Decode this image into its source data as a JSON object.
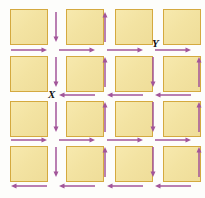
{
  "figure": {
    "name": "lattice-domain-diagram",
    "background_color": "#fdfdfb",
    "width": 205,
    "height": 198
  },
  "colors": {
    "square_fill": "#f4e4a4",
    "square_fill_light": "#f7e9ae",
    "square_border": "#d4a93f",
    "arrow": "#a2559a",
    "arrow_alt": "#9c4f93",
    "label_text": "#111111"
  },
  "grid": {
    "rows": 4,
    "columns": 4,
    "square_width": 38,
    "square_height": 36,
    "origin_x": 10,
    "origin_y": 9,
    "step_x": 48,
    "step_y": 45
  },
  "labels": [
    {
      "id": "label-y",
      "text": "Y",
      "x": 152,
      "y": 38
    },
    {
      "id": "label-x",
      "text": "X",
      "x": 48,
      "y": 89
    }
  ],
  "vertical_arrows": [
    {
      "id": "v-r0-g0",
      "x": 56,
      "y": 12,
      "length": 30,
      "direction": "down"
    },
    {
      "id": "v-r0-g1",
      "x": 105,
      "y": 12,
      "length": 30,
      "direction": "up"
    },
    {
      "id": "v-r1-g0",
      "x": 56,
      "y": 57,
      "length": 30,
      "direction": "down"
    },
    {
      "id": "v-r1-g1",
      "x": 105,
      "y": 57,
      "length": 30,
      "direction": "up"
    },
    {
      "id": "v-r1-g2",
      "x": 153,
      "y": 57,
      "length": 30,
      "direction": "down"
    },
    {
      "id": "v-r2-g0",
      "x": 56,
      "y": 102,
      "length": 30,
      "direction": "down"
    },
    {
      "id": "v-r2-g1",
      "x": 105,
      "y": 102,
      "length": 30,
      "direction": "up"
    },
    {
      "id": "v-r2-g2",
      "x": 153,
      "y": 102,
      "length": 30,
      "direction": "down"
    },
    {
      "id": "v-r3-g0",
      "x": 56,
      "y": 147,
      "length": 30,
      "direction": "down"
    },
    {
      "id": "v-r3-g1",
      "x": 105,
      "y": 147,
      "length": 30,
      "direction": "up"
    },
    {
      "id": "v-r3-g2",
      "x": 153,
      "y": 147,
      "length": 30,
      "direction": "down"
    },
    {
      "id": "v-edge-r1",
      "x": 199,
      "y": 57,
      "length": 30,
      "direction": "up"
    },
    {
      "id": "v-edge-r2",
      "x": 199,
      "y": 102,
      "length": 30,
      "direction": "up"
    },
    {
      "id": "v-edge-r3",
      "x": 199,
      "y": 147,
      "length": 30,
      "direction": "up"
    }
  ],
  "horizontal_arrows": [
    {
      "id": "h-b0-c0",
      "x": 11,
      "y": 50,
      "length": 36,
      "direction": "right"
    },
    {
      "id": "h-b0-c1",
      "x": 59,
      "y": 50,
      "length": 36,
      "direction": "right"
    },
    {
      "id": "h-b0-c2",
      "x": 107,
      "y": 50,
      "length": 36,
      "direction": "right"
    },
    {
      "id": "h-b0-c3",
      "x": 155,
      "y": 50,
      "length": 36,
      "direction": "right"
    },
    {
      "id": "h-b1-c1",
      "x": 59,
      "y": 95,
      "length": 36,
      "direction": "left"
    },
    {
      "id": "h-b1-c2",
      "x": 107,
      "y": 95,
      "length": 36,
      "direction": "left"
    },
    {
      "id": "h-b1-c3",
      "x": 155,
      "y": 95,
      "length": 36,
      "direction": "left"
    },
    {
      "id": "h-b2-c0",
      "x": 11,
      "y": 140,
      "length": 36,
      "direction": "right"
    },
    {
      "id": "h-b2-c1",
      "x": 59,
      "y": 140,
      "length": 36,
      "direction": "right"
    },
    {
      "id": "h-b2-c2",
      "x": 107,
      "y": 140,
      "length": 36,
      "direction": "right"
    },
    {
      "id": "h-b2-c3",
      "x": 155,
      "y": 140,
      "length": 36,
      "direction": "right"
    },
    {
      "id": "h-b3-c0",
      "x": 11,
      "y": 186,
      "length": 36,
      "direction": "left"
    },
    {
      "id": "h-b3-c1",
      "x": 59,
      "y": 186,
      "length": 36,
      "direction": "left"
    },
    {
      "id": "h-b3-c2",
      "x": 107,
      "y": 186,
      "length": 36,
      "direction": "left"
    },
    {
      "id": "h-b3-c3",
      "x": 155,
      "y": 186,
      "length": 36,
      "direction": "left"
    }
  ],
  "squares": [
    {
      "id": "sq-r0-c0",
      "row": 0,
      "col": 0,
      "x": 10,
      "y": 9
    },
    {
      "id": "sq-r0-c1",
      "row": 0,
      "col": 1,
      "x": 66,
      "y": 9
    },
    {
      "id": "sq-r0-c2",
      "row": 0,
      "col": 2,
      "x": 115,
      "y": 9
    },
    {
      "id": "sq-r0-c3",
      "row": 0,
      "col": 3,
      "x": 163,
      "y": 9
    },
    {
      "id": "sq-r1-c0",
      "row": 1,
      "col": 0,
      "x": 10,
      "y": 56
    },
    {
      "id": "sq-r1-c1",
      "row": 1,
      "col": 1,
      "x": 66,
      "y": 56
    },
    {
      "id": "sq-r1-c2",
      "row": 1,
      "col": 2,
      "x": 115,
      "y": 56
    },
    {
      "id": "sq-r1-c3",
      "row": 1,
      "col": 3,
      "x": 163,
      "y": 56
    },
    {
      "id": "sq-r2-c0",
      "row": 2,
      "col": 0,
      "x": 10,
      "y": 101
    },
    {
      "id": "sq-r2-c1",
      "row": 2,
      "col": 1,
      "x": 66,
      "y": 101
    },
    {
      "id": "sq-r2-c2",
      "row": 2,
      "col": 2,
      "x": 115,
      "y": 101
    },
    {
      "id": "sq-r2-c3",
      "row": 2,
      "col": 3,
      "x": 163,
      "y": 101
    },
    {
      "id": "sq-r3-c0",
      "row": 3,
      "col": 0,
      "x": 10,
      "y": 146
    },
    {
      "id": "sq-r3-c1",
      "row": 3,
      "col": 1,
      "x": 66,
      "y": 146
    },
    {
      "id": "sq-r3-c2",
      "row": 3,
      "col": 2,
      "x": 115,
      "y": 146
    },
    {
      "id": "sq-r3-c3",
      "row": 3,
      "col": 3,
      "x": 163,
      "y": 146
    }
  ]
}
